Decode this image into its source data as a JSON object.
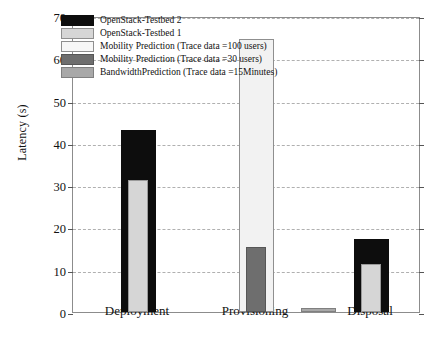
{
  "chart_data": {
    "type": "bar",
    "title": "",
    "xlabel": "",
    "ylabel": "Latency (s)",
    "ylim": [
      0,
      70
    ],
    "ytick_step": 10,
    "yticks": [
      0,
      10,
      20,
      30,
      40,
      50,
      60,
      70
    ],
    "grid": true,
    "grid_style": "dashed-horizontal",
    "legend_position": "top-left-inside",
    "categories": [
      "Deployment",
      "Provisioning",
      "Disposal"
    ],
    "series": [
      {
        "name": "OpenStack-Testbed 2",
        "color": "#0d0d0d",
        "values": [
          43.1,
          null,
          17.2
        ]
      },
      {
        "name": "OpenStack-Testbed 1",
        "color": "#d6d6d6",
        "values": [
          31.3,
          null,
          11.4
        ]
      },
      {
        "name": "Mobility Prediction (Trace data =100 users)",
        "color": "#f2f2f2",
        "values": [
          null,
          64.6,
          null
        ]
      },
      {
        "name": "Mobility Prediction (Trace data =30 users)",
        "color": "#6e6e6e",
        "values": [
          null,
          15.4,
          null
        ]
      },
      {
        "name": "BandwidthPrediction (Trace data =15Minutes)",
        "color": "#a8a8a8",
        "values": [
          null,
          null,
          1.0
        ]
      }
    ],
    "annotations": [
      "Bars are drawn overlapping: the shorter series of each group is centred in front of the taller one.",
      "The BandwidthPrediction bar (1.0 s) sits between the Provisioning and Disposal groups."
    ]
  },
  "legend": {
    "entries": [
      {
        "label": "OpenStack-Testbed 2",
        "swatch": "black"
      },
      {
        "label": "OpenStack-Testbed 1",
        "swatch": "lightgray"
      },
      {
        "label": "Mobility Prediction (Trace data =100 users)",
        "swatch": "offwhite"
      },
      {
        "label": "Mobility Prediction (Trace data =30 users)",
        "swatch": "darkgray"
      },
      {
        "label": "BandwidthPrediction (Trace data =15Minutes)",
        "swatch": "medgray"
      }
    ]
  },
  "axis": {
    "y_title": "Latency (s)",
    "y_labels": [
      "70",
      "60",
      "50",
      "40",
      "30",
      "20",
      "10",
      "0"
    ],
    "x_labels": [
      "Deployment",
      "Provisioning",
      "Disposal"
    ]
  }
}
